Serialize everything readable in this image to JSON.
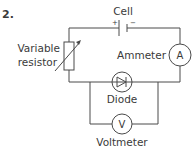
{
  "question": {
    "number": "2."
  },
  "components": {
    "cell": {
      "label": "Cell",
      "positive": "+",
      "negative": "−"
    },
    "variable_resistor": {
      "label_line1": "Variable",
      "label_line2": "resistor"
    },
    "ammeter": {
      "label": "Ammeter",
      "symbol": "A"
    },
    "diode": {
      "label": "Diode"
    },
    "voltmeter": {
      "label": "Voltmeter",
      "symbol": "V"
    }
  },
  "colors": {
    "line": "#4a4a4a",
    "text": "#3a3a3a",
    "background": "#ffffff"
  }
}
